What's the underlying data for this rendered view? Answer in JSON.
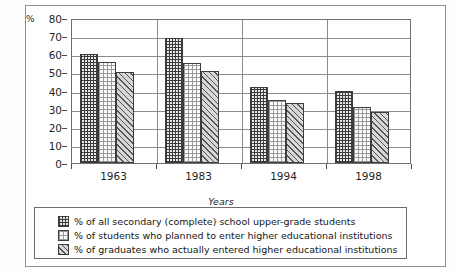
{
  "chart_data": {
    "type": "bar",
    "title": "",
    "xlabel": "Years",
    "ylabel": "%",
    "ylim": [
      0,
      80
    ],
    "yticks": [
      0,
      10,
      20,
      30,
      40,
      50,
      60,
      70,
      80
    ],
    "categories": [
      "1963",
      "1983",
      "1994",
      "1998"
    ],
    "grid": true,
    "legend_position": "below",
    "series": [
      {
        "name": "% of all secondary (complete) school upper-grade students",
        "pattern": "crosshatch-grid",
        "values": [
          60,
          69,
          42,
          40
        ]
      },
      {
        "name": "% of students who planned to enter higher educational institutions",
        "pattern": "fine-dotted",
        "values": [
          56,
          55,
          35,
          31
        ]
      },
      {
        "name": "% of graduates who actually entered higher educational institutions",
        "pattern": "diagonal-hatch",
        "values": [
          50,
          51,
          33,
          28
        ]
      }
    ]
  },
  "axis": {
    "unit_label": "%",
    "x_title": "Years"
  },
  "colors": {
    "frame": "#8f8f8f",
    "grid": "#8b8b8b",
    "text": "#1a1a1a",
    "bar_outline": "#3d3d3d",
    "series1_fill": "#e9e9e9",
    "series2_fill": "#fbfbfb",
    "series3_fill": "#d7d7d7"
  }
}
